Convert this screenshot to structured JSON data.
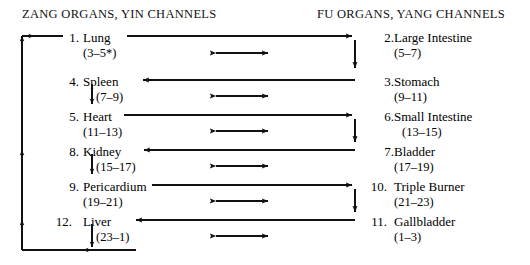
{
  "diagram": {
    "title_left": "ZANG ORGANS, YIN CHANNELS",
    "title_right": "FU ORGANS, YANG CHANNELS",
    "left_column": [
      {
        "num": "1.",
        "name": "Lung",
        "hours": "(3–5*)"
      },
      {
        "num": "4.",
        "name": "Spleen",
        "hours": "(7–9)"
      },
      {
        "num": "5.",
        "name": "Heart",
        "hours": "(11–13)"
      },
      {
        "num": "8.",
        "name": "Kidney",
        "hours": "(15–17)"
      },
      {
        "num": "9.",
        "name": "Pericardium",
        "hours": "(19–21)"
      },
      {
        "num": "12.",
        "name": "Liver",
        "hours": "(23–1)"
      }
    ],
    "right_column": [
      {
        "num": "2.",
        "name": "Large Intestine",
        "hours": "(5–7)"
      },
      {
        "num": "3.",
        "name": "Stomach",
        "hours": "(9–11)"
      },
      {
        "num": "6.",
        "name": "Small Intestine",
        "hours": "(13–15)"
      },
      {
        "num": "7.",
        "name": "Bladder",
        "hours": "(17–19)"
      },
      {
        "num": "10.",
        "name": "Triple Burner",
        "hours": "(21–23)"
      },
      {
        "num": "11.",
        "name": "Gallbladder",
        "hours": "(1–3)"
      }
    ],
    "ink_color": "#111111"
  }
}
